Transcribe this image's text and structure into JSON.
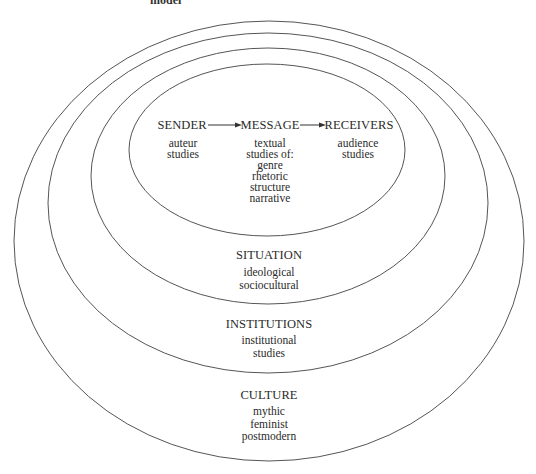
{
  "figure": {
    "top_caption_partial": "model",
    "stroke_color": "#555555",
    "text_color": "#2a2a2a",
    "background": "#ffffff"
  },
  "communication_chain": {
    "sender": {
      "label": "SENDER",
      "studies": [
        "auteur",
        "studies"
      ]
    },
    "message": {
      "label": "MESSAGE",
      "studies": [
        "textual",
        "studies of:",
        "genre",
        "rhetoric",
        "structure",
        "narrative"
      ]
    },
    "receivers": {
      "label": "RECEIVERS",
      "studies": [
        "audience",
        "studies"
      ]
    },
    "arrows": [
      "sender-to-message",
      "message-to-receivers"
    ]
  },
  "rings": [
    {
      "name": "communication",
      "label": "",
      "cx": 267,
      "cy": 150,
      "rx": 138,
      "ry": 86
    },
    {
      "name": "situation",
      "label": "SITUATION",
      "items": [
        "ideological",
        "sociocultural"
      ],
      "cx": 268,
      "cy": 176,
      "rx": 177,
      "ry": 128
    },
    {
      "name": "institutions",
      "label": "INSTITUTIONS",
      "items": [
        "institutional",
        "studies"
      ],
      "cx": 268,
      "cy": 203,
      "rx": 220,
      "ry": 170
    },
    {
      "name": "culture",
      "label": "CULTURE",
      "items": [
        "mythic",
        "feminist",
        "postmodern"
      ],
      "cx": 269,
      "cy": 241,
      "rx": 255,
      "ry": 220
    }
  ]
}
